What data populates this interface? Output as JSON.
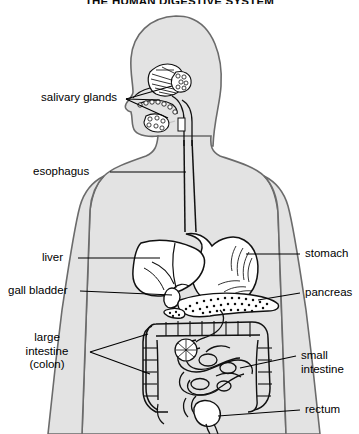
{
  "title": "THE HUMAN DIGESTIVE SYSTEM",
  "colors": {
    "background": "#ffffff",
    "body_fill": "#e3e3e3",
    "body_outline": "#6b6b6b",
    "organ_outline": "#111111",
    "organ_fill": "#ffffff",
    "leader_line": "#000000",
    "text": "#000000"
  },
  "labels": {
    "salivary_glands": "salivary glands",
    "esophagus": "esophagus",
    "liver": "liver",
    "gall_bladder": "gall bladder",
    "large_intestine_line1": "large",
    "large_intestine_line2": "intestine",
    "large_intestine_line3": "(colon)",
    "stomach": "stomach",
    "pancreas": "pancreas",
    "small_intestine_line1": "small",
    "small_intestine_line2": "intestine",
    "rectum": "rectum"
  },
  "diagram": {
    "view": "anterior-body-silhouette-with-head-in-profile",
    "organ_count": 8,
    "organs": [
      "salivary glands",
      "esophagus",
      "liver",
      "gall bladder",
      "stomach",
      "pancreas",
      "large intestine (colon)",
      "small intestine",
      "rectum"
    ]
  }
}
